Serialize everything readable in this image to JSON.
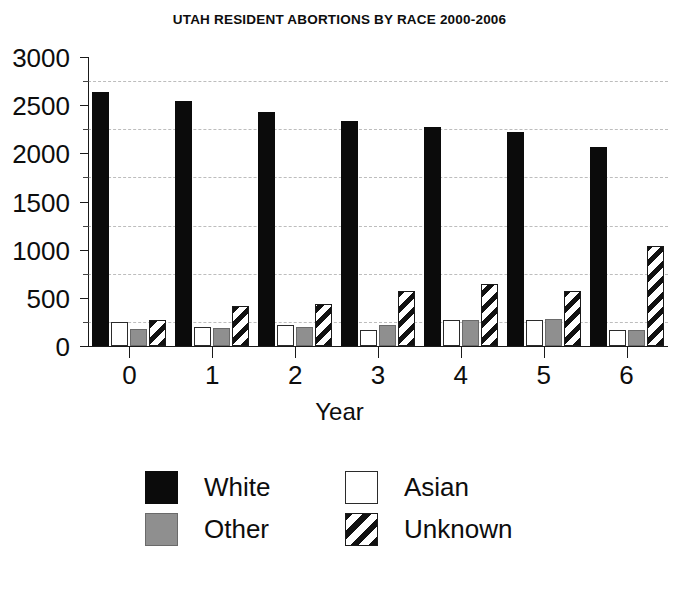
{
  "chart_data": {
    "type": "bar",
    "title": "UTAH RESIDENT ABORTIONS BY RACE 2000-2006",
    "xlabel": "Year",
    "ylabel": "",
    "categories": [
      "0",
      "1",
      "2",
      "3",
      "4",
      "5",
      "6"
    ],
    "series": [
      {
        "name": "White",
        "pattern": "solid-black",
        "color": "#0b0b0b",
        "values": [
          2635,
          2545,
          2430,
          2340,
          2270,
          2225,
          2070
        ]
      },
      {
        "name": "Asian",
        "pattern": "empty-white",
        "color": "#ffffff",
        "values": [
          245,
          195,
          215,
          165,
          270,
          275,
          170
        ]
      },
      {
        "name": "Other",
        "pattern": "solid-gray",
        "color": "#8f8f8f",
        "values": [
          175,
          185,
          200,
          215,
          265,
          280,
          170
        ]
      },
      {
        "name": "Unknown",
        "pattern": "diagonal-hatch",
        "color": "#111111",
        "values": [
          265,
          415,
          435,
          575,
          645,
          570,
          1035
        ]
      }
    ],
    "ylim": [
      0,
      3000
    ],
    "yticks": [
      0,
      500,
      1000,
      1500,
      2000,
      2500,
      3000
    ],
    "ytick_labels": [
      "0",
      "500",
      "1000",
      "1500",
      "2000",
      "2500",
      "3000"
    ],
    "yminor_ticks": [
      250,
      750,
      1250,
      1750,
      2250,
      2750
    ],
    "grid": "horizontal-dashed",
    "grid_values": [
      250,
      750,
      1250,
      1750,
      2250,
      2750
    ],
    "legend_position": "bottom-center",
    "legend": [
      "White",
      "Asian",
      "Other",
      "Unknown"
    ]
  }
}
